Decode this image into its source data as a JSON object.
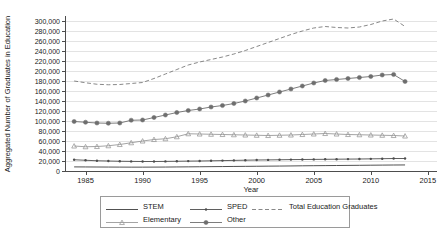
{
  "chart_data": {
    "type": "line",
    "title": "",
    "xlabel": "Year",
    "ylabel": "Aggregated Number of Graduates in Education",
    "xlim": [
      1983.2,
      2015.8
    ],
    "ylim": [
      0,
      310000
    ],
    "grid": true,
    "legend_position": "bottom",
    "xticks": [
      1985,
      1990,
      1995,
      2000,
      2005,
      2010,
      2015
    ],
    "xtick_labels": [
      "1985",
      "1990",
      "1995",
      "2000",
      "2005",
      "2010",
      "2015"
    ],
    "yticks": [
      0,
      20000,
      40000,
      60000,
      80000,
      100000,
      120000,
      140000,
      160000,
      180000,
      200000,
      220000,
      240000,
      260000,
      280000,
      300000
    ],
    "ytick_labels": [
      "0",
      "20,000",
      "40,000",
      "60,000",
      "80,000",
      "100,000",
      "120,000",
      "140,000",
      "160,000",
      "180,000",
      "200,000",
      "220,000",
      "240,000",
      "260,000",
      "280,000",
      "300,000"
    ],
    "x": [
      1984,
      1985,
      1986,
      1987,
      1988,
      1989,
      1990,
      1991,
      1992,
      1993,
      1994,
      1995,
      1996,
      1997,
      1998,
      1999,
      2000,
      2001,
      2002,
      2003,
      2004,
      2005,
      2006,
      2007,
      2008,
      2009,
      2010,
      2011,
      2012,
      2013
    ],
    "series": [
      {
        "name": "STEM",
        "color": "#3d3d3d",
        "style": "solid",
        "marker": "none",
        "values": [
          8200,
          8100,
          8000,
          7900,
          7800,
          7700,
          7700,
          7800,
          7900,
          8100,
          8300,
          8500,
          8700,
          8900,
          9100,
          9300,
          9500,
          9700,
          9900,
          10100,
          10400,
          10600,
          10800,
          11000,
          11200,
          11400,
          11600,
          11800,
          12000,
          12100
        ]
      },
      {
        "name": "Elementary",
        "color": "#9a9a9a",
        "style": "solid",
        "marker": "triangle",
        "values": [
          50000,
          48500,
          49000,
          50500,
          53000,
          56500,
          60000,
          63000,
          64500,
          68500,
          74500,
          74000,
          73500,
          73000,
          72500,
          72000,
          71500,
          71000,
          71500,
          72000,
          73000,
          74000,
          75000,
          74000,
          73000,
          72500,
          72000,
          71500,
          71000,
          70000
        ]
      },
      {
        "name": "SPED",
        "color": "#4d4d4d",
        "style": "solid",
        "marker": "small-dot",
        "values": [
          22500,
          21500,
          20500,
          20000,
          19500,
          19200,
          19000,
          19000,
          19200,
          19500,
          19800,
          20000,
          20400,
          20800,
          21200,
          21600,
          22000,
          22200,
          22500,
          22800,
          23000,
          23200,
          23400,
          23600,
          23800,
          24000,
          24300,
          24600,
          25000,
          25000
        ]
      },
      {
        "name": "Other",
        "color": "#6e6e6e",
        "style": "solid",
        "marker": "circle",
        "values": [
          99000,
          97500,
          96000,
          95500,
          96000,
          101500,
          102000,
          107000,
          112000,
          117000,
          121000,
          124000,
          128000,
          131000,
          135000,
          140000,
          146000,
          152000,
          158000,
          164000,
          170000,
          176000,
          181000,
          183000,
          185000,
          187000,
          189000,
          192000,
          193000,
          179000
        ]
      },
      {
        "name": "Total Education Graduates",
        "color": "#7a7a7a",
        "style": "dashed",
        "marker": "none",
        "values": [
          180000,
          176500,
          173500,
          172500,
          173000,
          175000,
          177000,
          185000,
          194000,
          203000,
          212000,
          218000,
          223000,
          228000,
          234000,
          241000,
          249000,
          257000,
          265000,
          273000,
          280000,
          286000,
          289000,
          287000,
          286000,
          288000,
          293000,
          300000,
          304000,
          289000
        ]
      }
    ]
  },
  "legend": {
    "entries": [
      {
        "label": "STEM"
      },
      {
        "label": "SPED"
      },
      {
        "label": "Total Education Graduates"
      },
      {
        "label": "Elementary"
      },
      {
        "label": "Other"
      }
    ]
  }
}
